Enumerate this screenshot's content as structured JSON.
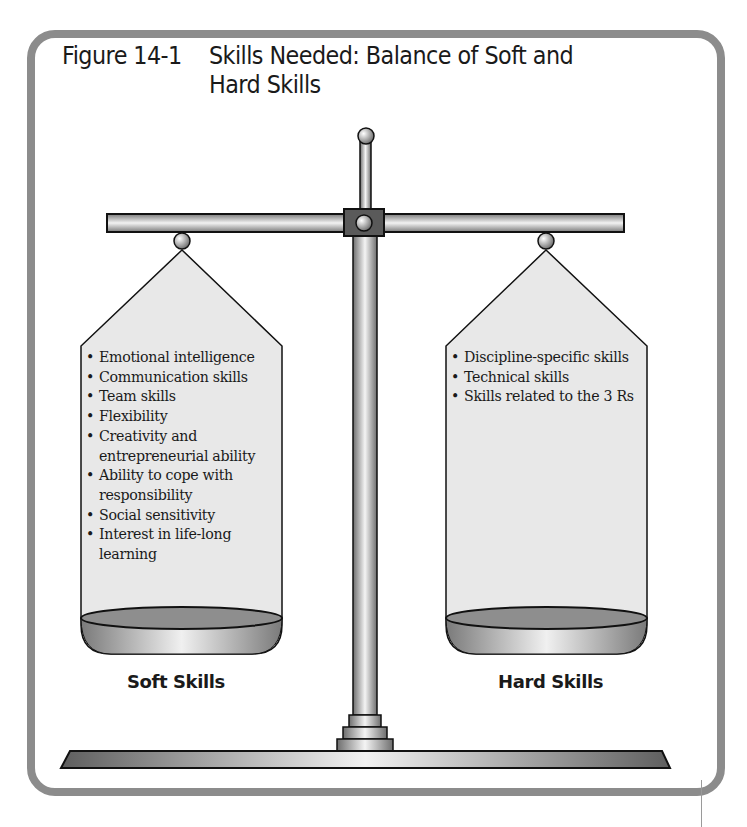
{
  "figure": {
    "number": "Figure 14-1",
    "caption": "Skills Needed: Balance of Soft and Hard Skills"
  },
  "left_pan": {
    "label": "Soft Skills",
    "items": [
      "Emotional intelligence",
      "Communication skills",
      "Team skills",
      "Flexibility",
      "Creativity and entrepreneurial ability",
      "Ability to cope with responsibility",
      "Social sensitivity",
      "Interest in life-long learning"
    ]
  },
  "right_pan": {
    "label": "Hard Skills",
    "items": [
      "Discipline-specific skills",
      "Technical skills",
      "Skills related to the 3 Rs"
    ]
  },
  "colors": {
    "frame": "#8c8c8c",
    "pan_fill": "#e8e8e8",
    "metal_dark": "#6e6e6e",
    "metal_light": "#f4f4f4",
    "outline": "#111111"
  }
}
